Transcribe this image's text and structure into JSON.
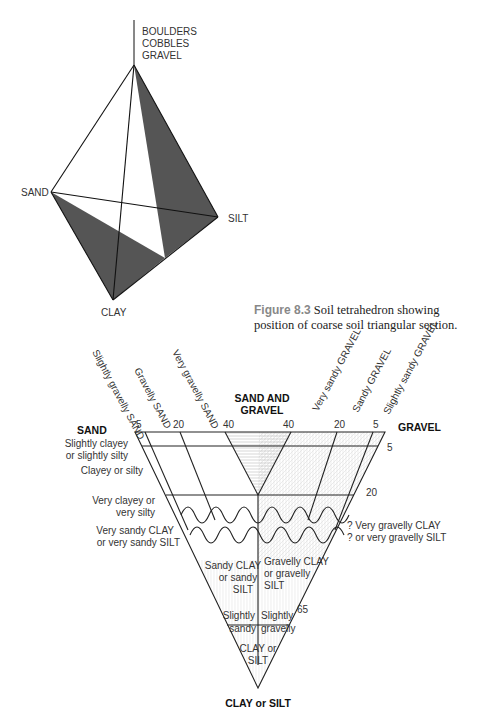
{
  "tetrahedron": {
    "top_label_lines": [
      "BOULDERS",
      "COBBLES",
      "GRAVEL"
    ],
    "vertex_sand": "SAND",
    "vertex_silt": "SILT",
    "vertex_clay": "CLAY",
    "shade_color": "#555555"
  },
  "caption_8_3": {
    "figure_label": "Figure 8.3",
    "text": "Soil tetrahedron showing position of coarse soil triangular section."
  },
  "triangle": {
    "corner_left": "SAND",
    "corner_top_line1": "SAND AND",
    "corner_top_line2": "GRAVEL",
    "corner_right": "GRAVEL",
    "corner_bottom": "CLAY or SILT",
    "top_ticks": [
      "5",
      "20",
      "40",
      "40",
      "20",
      "5"
    ],
    "right_ticks": [
      "5",
      "20",
      "65"
    ],
    "column_labels": [
      "Slightly gravelly SAND",
      "Gravelly SAND",
      "Very gravelly SAND",
      "Very sandy GRAVEL",
      "Sandy GRAVEL",
      "Slightly sandy GRAVEL"
    ],
    "left_row_labels": {
      "r1a": "Slightly clayey",
      "r1b": "or slightly silty",
      "r2": "Clayey or silty",
      "r3a": "Very clayey or",
      "r3b": "very silty",
      "r4a": "Very sandy CLAY",
      "r4b": "or very sandy SILT"
    },
    "right_row_labels": {
      "a": "? Very gravelly CLAY",
      "b": "? or very gravelly SILT"
    },
    "inner_labels": {
      "sandy_clay_1": "Sandy CLAY",
      "sandy_clay_2": "or sandy",
      "sandy_clay_3": "SILT",
      "gravelly_clay_1": "Gravelly CLAY",
      "gravelly_clay_2": "or gravelly",
      "gravelly_clay_3": "SILT",
      "slightly_1": "Slightly",
      "sandy": "sandy",
      "slightly_2": "Slightly",
      "gravelly": "gravelly",
      "clay_or": "CLAY or",
      "silt": "SILT"
    }
  }
}
